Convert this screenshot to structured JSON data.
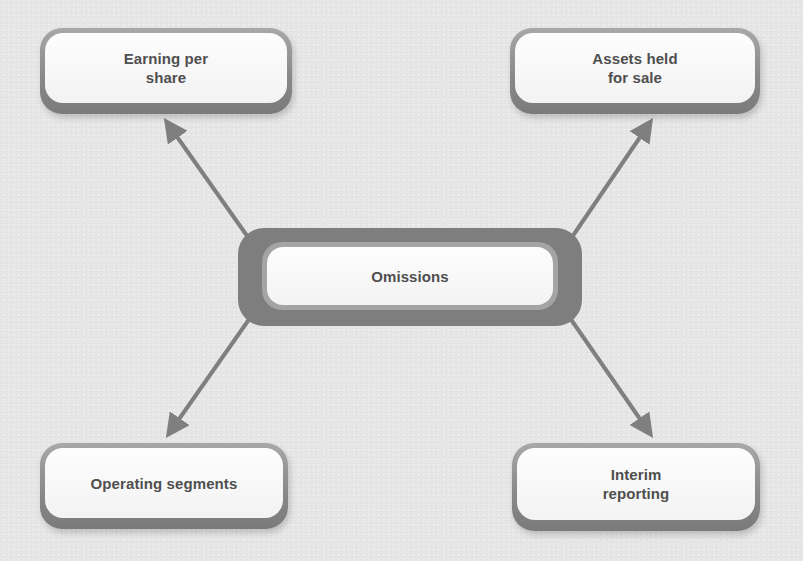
{
  "diagram": {
    "type": "hub-and-spoke",
    "center": {
      "id": "omissions",
      "label": "Omissions"
    },
    "nodes": [
      {
        "id": "earning-per-share",
        "label": "Earning per\nshare",
        "position": "top-left"
      },
      {
        "id": "assets-held-for-sale",
        "label": "Assets held\nfor sale",
        "position": "top-right"
      },
      {
        "id": "operating-segments",
        "label": "Operating segments",
        "position": "bottom-left"
      },
      {
        "id": "interim-reporting",
        "label": "Interim\nreporting",
        "position": "bottom-right"
      }
    ],
    "edges": [
      {
        "from": "omissions",
        "to": "earning-per-share",
        "direction": "outward-arrow"
      },
      {
        "from": "omissions",
        "to": "assets-held-for-sale",
        "direction": "outward-arrow"
      },
      {
        "from": "omissions",
        "to": "operating-segments",
        "direction": "outward-arrow"
      },
      {
        "from": "omissions",
        "to": "interim-reporting",
        "direction": "outward-arrow"
      }
    ],
    "colors": {
      "background": "#e6e6e6",
      "arrow": "#7f7f7f",
      "node_border": "#8a8a8a",
      "node_fill": "#f8f8f8",
      "text": "#4f4f4f"
    }
  }
}
